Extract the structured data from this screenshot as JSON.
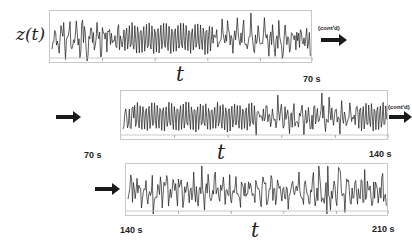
{
  "figure": {
    "y_label": "z(t)",
    "x_label": "t",
    "continued_label": "(cont'd)",
    "line_color": "#1a1a1a",
    "frame_color": "#c8c8c8"
  },
  "chart_data": [
    {
      "type": "line",
      "title": "",
      "xlabel": "t",
      "ylabel": "z(t)",
      "x_range_s": [
        0,
        70
      ],
      "start_label": "",
      "end_label": "70 s",
      "continued": true,
      "description": "Oscillatory time series; irregular large spikes for first ~15 s, then dense regular high-frequency oscillation (~15–45 s), then irregular oscillation to 70 s"
    },
    {
      "type": "line",
      "title": "",
      "xlabel": "t",
      "ylabel": "",
      "x_range_s": [
        70,
        140
      ],
      "start_label": "70 s",
      "end_label": "140 s",
      "continued": true,
      "description": "Dense regular oscillation ~72–105 s, then irregular spiky oscillation, dense regular oscillation again near 135–140 s"
    },
    {
      "type": "line",
      "title": "",
      "xlabel": "t",
      "ylabel": "",
      "x_range_s": [
        140,
        210
      ],
      "start_label": "140 s",
      "end_label": "210 s",
      "continued": false,
      "description": "Irregular chaotic oscillation with occasional large spikes throughout"
    }
  ]
}
